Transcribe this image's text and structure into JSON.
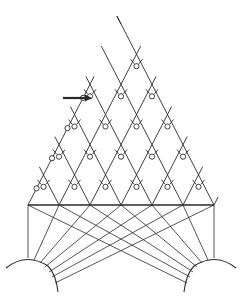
{
  "figure": {
    "colors": {
      "ink": "#2a2a2a",
      "background": "#ffffff"
    },
    "base": {
      "y": 205,
      "x_start": 28,
      "spacing": 31,
      "vertices": 7
    },
    "lattice": {
      "apex_x": 121,
      "apex_y": 24,
      "row_height": 30.2,
      "rows": 6
    },
    "left_truncation_rows": 2,
    "arrow": {
      "x1": 63,
      "x2": 92,
      "y": 98,
      "points_to": "node-circle"
    },
    "arcs": [
      {
        "name": "left-base-arc",
        "cx": 28,
        "cy": 300,
        "r": 42
      },
      {
        "name": "right-base-arc",
        "cx": 214,
        "cy": 300,
        "r": 42
      }
    ],
    "fan_targets": {
      "left": [
        [
          28,
          258
        ],
        [
          34,
          260
        ],
        [
          40,
          263
        ],
        [
          45,
          267
        ],
        [
          49,
          272
        ],
        [
          52,
          277
        ],
        [
          55,
          283
        ]
      ],
      "right": [
        [
          214,
          258
        ],
        [
          208,
          260
        ],
        [
          202,
          263
        ],
        [
          197,
          267
        ],
        [
          193,
          272
        ],
        [
          190,
          277
        ],
        [
          187,
          283
        ]
      ]
    }
  }
}
